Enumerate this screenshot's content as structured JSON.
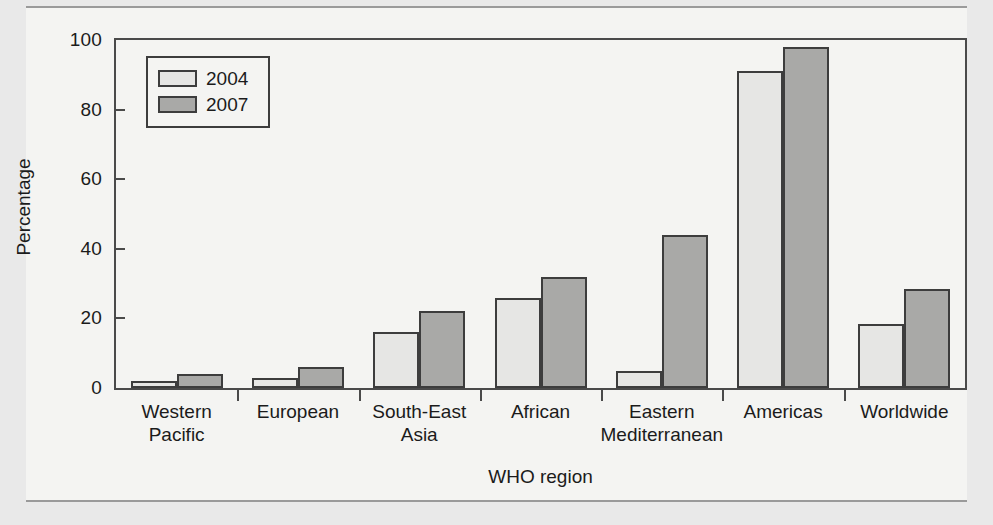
{
  "figure": {
    "background_color": "#f4f4f2",
    "page_background_color": "#e9e9e9"
  },
  "chart_data": {
    "type": "bar",
    "title": "",
    "subtitle": "",
    "xlabel": "WHO region",
    "ylabel": "Percentage",
    "categories": [
      "Western\nPacific",
      "European",
      "South-East\nAsia",
      "African",
      "Eastern\nMediterranean",
      "Americas",
      "Worldwide"
    ],
    "category_lines": [
      [
        "Western",
        "Pacific"
      ],
      [
        "European",
        ""
      ],
      [
        "South-East",
        "Asia"
      ],
      [
        "African",
        ""
      ],
      [
        "Eastern",
        "Mediterranean"
      ],
      [
        "Americas",
        ""
      ],
      [
        "Worldwide",
        ""
      ]
    ],
    "series": [
      {
        "name": "2004",
        "color": "#e6e6e4",
        "values": [
          2,
          3,
          16,
          26,
          5,
          91,
          18.5
        ]
      },
      {
        "name": "2007",
        "color": "#a9a9a7",
        "values": [
          4,
          6,
          22,
          32,
          44,
          98,
          28.5
        ]
      }
    ],
    "ylim": [
      0,
      100
    ],
    "yticks": [
      0,
      20,
      40,
      60,
      80,
      100
    ],
    "ytick_labels": [
      "0",
      "20",
      "40",
      "60",
      "80",
      "100"
    ],
    "grid": false,
    "legend_position": "upper left",
    "bar_border_color": "#3d3d3d",
    "axis_color": "#4a4a4a"
  },
  "legend": {
    "entries": [
      {
        "label": "2004",
        "swatch": "light-gray-swatch"
      },
      {
        "label": "2007",
        "swatch": "dark-gray-swatch"
      }
    ]
  }
}
